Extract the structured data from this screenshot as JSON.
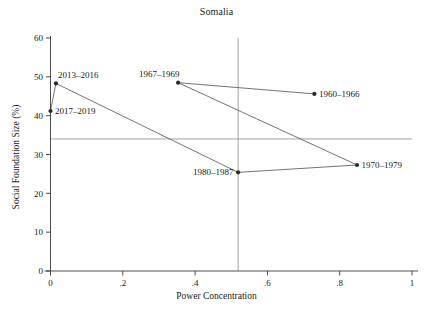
{
  "chart_data": {
    "type": "scatter",
    "title": "Somalia",
    "xlabel": "Power Concentration",
    "ylabel": "Social Foundation Size (%)",
    "xlim": [
      0,
      1
    ],
    "ylim": [
      0,
      60
    ],
    "grid": false,
    "legend": "none",
    "connected": true,
    "xticks": [
      "0",
      ".2",
      ".4",
      ".6",
      ".8",
      "1"
    ],
    "xtick_values": [
      0,
      0.2,
      0.4,
      0.6,
      0.8,
      1
    ],
    "yticks": [
      "0",
      "10",
      "20",
      "30",
      "40",
      "50",
      "60"
    ],
    "ytick_values": [
      0,
      10,
      20,
      30,
      40,
      50,
      60
    ],
    "points": [
      {
        "label": "1960–1966",
        "x": 0.73,
        "y": 45.6,
        "label_pos": "right"
      },
      {
        "label": "1967–1969",
        "x": 0.353,
        "y": 48.5,
        "label_pos": "above-left"
      },
      {
        "label": "1970–1979",
        "x": 0.848,
        "y": 27.3,
        "label_pos": "right"
      },
      {
        "label": "1980–1987",
        "x": 0.519,
        "y": 25.4,
        "label_pos": "left"
      },
      {
        "label": "2013–2016",
        "x": 0.015,
        "y": 48.3,
        "label_pos": "above-right"
      },
      {
        "label": "2017–2019",
        "x": 0.0,
        "y": 41.2,
        "label_pos": "right"
      }
    ],
    "path_order": [
      "1960–1966",
      "1967–1969",
      "1970–1979",
      "1980–1987",
      "2013–2016",
      "2017–2019"
    ],
    "reference_lines": [
      {
        "orientation": "horizontal",
        "value": 34.0,
        "axis": "y"
      },
      {
        "orientation": "vertical",
        "value": 0.519,
        "axis": "x"
      }
    ],
    "colors": {
      "marker": "#2b2b2b",
      "line": "#5b5b5b",
      "reference": "#8d8d8d",
      "axis": "#3a3a3a",
      "background": "#ffffff"
    }
  }
}
